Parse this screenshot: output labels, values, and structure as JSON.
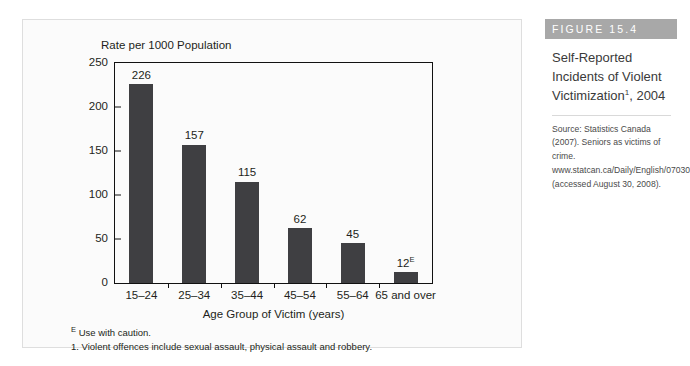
{
  "chart_data": {
    "type": "bar",
    "ylabel": "Rate per 1000 Population",
    "xlabel": "Age Group of Victim (years)",
    "categories": [
      "15–24",
      "25–34",
      "35–44",
      "45–54",
      "55–64",
      "65 and over"
    ],
    "values": [
      226,
      157,
      115,
      62,
      45,
      12
    ],
    "value_labels": [
      "226",
      "157",
      "115",
      "62",
      "45",
      "12"
    ],
    "value_label_superscripts": [
      "",
      "",
      "",
      "",
      "",
      "E"
    ],
    "ylim": [
      0,
      250
    ],
    "yticks": [
      0,
      50,
      100,
      150,
      200,
      250
    ],
    "ytick_labels": [
      "0",
      "50",
      "100",
      "150",
      "200",
      "250"
    ],
    "grid": false,
    "legend": false,
    "bar_color": "#3f3f42",
    "axis_color": "#111111",
    "panel_background": "#fbfbfb"
  },
  "footnotes": {
    "caution": {
      "marker": "E",
      "text": "Use with caution."
    },
    "note_one": "1. Violent offences include sexual assault, physical assault and robbery."
  },
  "sidebar": {
    "header_label": "FIGURE 15.4",
    "header_color": "#a8a8a8",
    "title_line1": "Self-Reported",
    "title_line2": "Incidents of Violent",
    "title_line3_prefix": "Victimization",
    "title_superscript": "1",
    "title_line3_suffix": ", 2004",
    "source": "Source: Statistics Canada (2007). Seniors as victims of crime. www.statcan.ca/Daily/English/070306/d070306b.htm (accessed August 30, 2008)."
  }
}
